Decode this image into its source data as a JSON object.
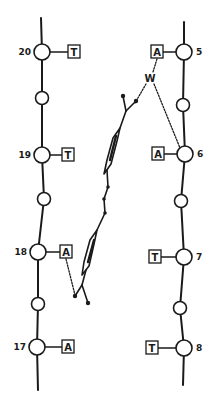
{
  "diagram": {
    "colors": {
      "ink": "#1a1a1a",
      "background": "#ffffff"
    },
    "left_strand": {
      "nucleotides": [
        {
          "number": "20",
          "base": "T"
        },
        {
          "number": "19",
          "base": "T"
        },
        {
          "number": "18",
          "base": "A"
        },
        {
          "number": "17",
          "base": "A"
        }
      ]
    },
    "right_strand": {
      "nucleotides": [
        {
          "number": "5",
          "base": "A"
        },
        {
          "number": "6",
          "base": "A"
        },
        {
          "number": "7",
          "base": "T"
        },
        {
          "number": "8",
          "base": "T"
        }
      ]
    },
    "water_label": "W",
    "ligand": {
      "name": "bis-phenyl ligand",
      "rings": 2
    }
  }
}
